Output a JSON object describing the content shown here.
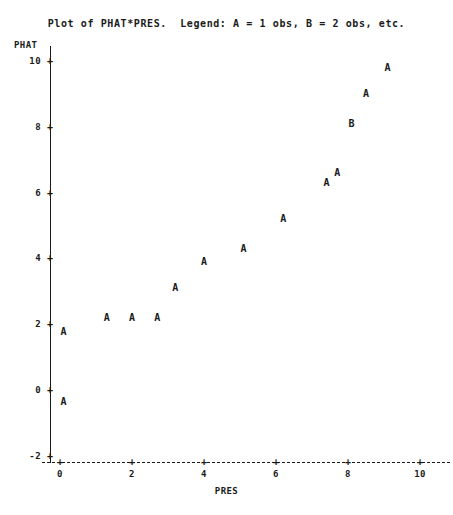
{
  "title": "Plot of PHAT*PRES.  Legend: A = 1 obs, B = 2 obs, etc.",
  "axes": {
    "y_variable": "PHAT",
    "x_variable": "PRES",
    "y_tick_glyph": "+",
    "x_tick_glyph": "+"
  },
  "chart_data": {
    "type": "scatter",
    "title": "Plot of PHAT*PRES.  Legend: A = 1 obs, B = 2 obs, etc.",
    "xlabel": "PRES",
    "ylabel": "PHAT",
    "xlim": [
      -0.35,
      10.9
    ],
    "ylim": [
      -2.45,
      10.5
    ],
    "xticks": [
      0,
      2,
      4,
      6,
      8,
      10
    ],
    "yticks": [
      -2,
      0,
      2,
      4,
      6,
      8,
      10
    ],
    "xtick_labels": [
      "0",
      "2",
      "4",
      "6",
      "8",
      "10"
    ],
    "ytick_labels": [
      "-2",
      "0",
      "2",
      "4",
      "6",
      "8",
      "10"
    ],
    "grid": false,
    "legend": "A = 1 obs, B = 2 obs, etc.",
    "marker_legend": [
      {
        "symbol": "A",
        "count": 1,
        "description": "1 obs"
      },
      {
        "symbol": "B",
        "count": 2,
        "description": "2 obs"
      }
    ],
    "points": [
      {
        "x": 0.1,
        "y": -0.35,
        "symbol": "A",
        "count": 1
      },
      {
        "x": 0.1,
        "y": 1.75,
        "symbol": "A",
        "count": 1
      },
      {
        "x": 1.3,
        "y": 2.2,
        "symbol": "A",
        "count": 1
      },
      {
        "x": 2.0,
        "y": 2.2,
        "symbol": "A",
        "count": 1
      },
      {
        "x": 2.7,
        "y": 2.2,
        "symbol": "A",
        "count": 1
      },
      {
        "x": 3.2,
        "y": 3.1,
        "symbol": "A",
        "count": 1
      },
      {
        "x": 4.0,
        "y": 3.9,
        "symbol": "A",
        "count": 1
      },
      {
        "x": 5.1,
        "y": 4.3,
        "symbol": "A",
        "count": 1
      },
      {
        "x": 6.2,
        "y": 5.2,
        "symbol": "A",
        "count": 1
      },
      {
        "x": 7.4,
        "y": 6.3,
        "symbol": "A",
        "count": 1
      },
      {
        "x": 7.7,
        "y": 6.6,
        "symbol": "A",
        "count": 1
      },
      {
        "x": 8.1,
        "y": 8.1,
        "symbol": "B",
        "count": 2
      },
      {
        "x": 8.5,
        "y": 9.0,
        "symbol": "A",
        "count": 1
      },
      {
        "x": 9.1,
        "y": 9.8,
        "symbol": "A",
        "count": 1
      }
    ]
  },
  "colors": {
    "ink": "#1a1a1a",
    "background": "#ffffff"
  }
}
